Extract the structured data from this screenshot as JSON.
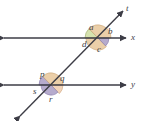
{
  "figure": {
    "type": "geometry-diagram",
    "width": 142,
    "height": 121,
    "background_color": "#ffffff",
    "line_color": "#3d3d46",
    "label_color": "#3d3d46"
  },
  "lines": [
    {
      "id": "line-t",
      "label": "t",
      "kind": "transversal",
      "arrows": "both",
      "x1": 20,
      "y1": 116,
      "x2": 123,
      "y2": 11,
      "label_x": 126,
      "label_y": 4
    },
    {
      "id": "line-x",
      "label": "x",
      "kind": "horizontal",
      "arrows": "both",
      "x1": 4,
      "y1": 38,
      "x2": 126,
      "y2": 38,
      "label_x": 131,
      "label_y": 33
    },
    {
      "id": "line-y",
      "label": "y",
      "kind": "horizontal",
      "arrows": "both",
      "x1": 4,
      "y1": 85,
      "x2": 126,
      "y2": 85,
      "label_x": 131,
      "label_y": 80
    }
  ],
  "intersections": [
    {
      "id": "upper",
      "x": 98,
      "y": 38,
      "lines": [
        "line-t",
        "line-x"
      ]
    },
    {
      "id": "lower",
      "x": 51,
      "y": 85,
      "lines": [
        "line-t",
        "line-y"
      ]
    }
  ],
  "angles": [
    {
      "id": "angle-a",
      "label": "a",
      "intersection": "upper",
      "position": "above-left",
      "fill": "#cfdda0",
      "stroke": "#9aa86a",
      "cx": 98,
      "cy": 38,
      "r": 13,
      "start_deg": 134,
      "end_deg": 180,
      "label_x": 89,
      "label_y": 23
    },
    {
      "id": "angle-b",
      "label": "b",
      "intersection": "upper",
      "position": "above-right",
      "fill": "#e8c79a",
      "stroke": "#c9a273",
      "cx": 98,
      "cy": 38,
      "r": 13,
      "start_deg": 0,
      "end_deg": 134,
      "label_x": 108,
      "label_y": 27
    },
    {
      "id": "angle-c",
      "label": "c",
      "intersection": "upper",
      "position": "below-right",
      "fill": "#a99cc4",
      "stroke": "#8477a8",
      "cx": 98,
      "cy": 38,
      "r": 11,
      "start_deg": 314,
      "end_deg": 360,
      "label_x": 97,
      "label_y": 45
    },
    {
      "id": "angle-d",
      "label": "d",
      "intersection": "upper",
      "position": "below-left",
      "fill": "#e8c79a",
      "stroke": "#c9a273",
      "cx": 98,
      "cy": 38,
      "r": 12,
      "start_deg": 180,
      "end_deg": 314,
      "label_x": 82,
      "label_y": 40
    },
    {
      "id": "angle-p",
      "label": "p",
      "intersection": "lower",
      "position": "above-left",
      "fill": "#a99cc4",
      "stroke": "#8477a8",
      "cx": 51,
      "cy": 85,
      "r": 12,
      "start_deg": 134,
      "end_deg": 180,
      "label_x": 40,
      "label_y": 70
    },
    {
      "id": "angle-q",
      "label": "q",
      "intersection": "lower",
      "position": "above-right",
      "fill": "#e8c79a",
      "stroke": "#c9a273",
      "cx": 51,
      "cy": 85,
      "r": 12,
      "start_deg": 0,
      "end_deg": 134,
      "label_x": 60,
      "label_y": 74
    },
    {
      "id": "angle-r",
      "label": "r",
      "intersection": "lower",
      "position": "below-right",
      "fill": "#f0cdae",
      "stroke": "#d0a983",
      "cx": 51,
      "cy": 85,
      "r": 12,
      "start_deg": 314,
      "end_deg": 360,
      "label_x": 49,
      "label_y": 95
    },
    {
      "id": "angle-s",
      "label": "s",
      "intersection": "lower",
      "position": "below-left",
      "fill": "#a99cc4",
      "stroke": "#8477a8",
      "cx": 51,
      "cy": 85,
      "r": 10,
      "start_deg": 180,
      "end_deg": 314,
      "label_x": 33,
      "label_y": 87
    }
  ]
}
